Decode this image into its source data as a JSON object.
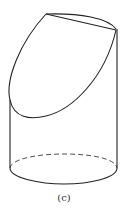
{
  "figure": {
    "caption": "(c)",
    "stroke_color": "#222222"
  }
}
